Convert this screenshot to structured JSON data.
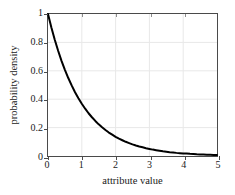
{
  "chart_data": {
    "type": "line",
    "title": "",
    "xlabel": "attribute value",
    "ylabel": "probability density",
    "xlim": [
      0,
      5
    ],
    "ylim": [
      0,
      1
    ],
    "xticks": [
      0,
      1,
      2,
      3,
      4,
      5
    ],
    "xtick_labels": [
      "0",
      "1",
      "2",
      "3",
      "4",
      "5"
    ],
    "yticks": [
      0,
      0.2,
      0.4,
      0.6,
      0.8,
      1
    ],
    "ytick_labels": [
      "0",
      "0.2",
      "0.4",
      "0.6",
      "0.8",
      "1"
    ],
    "grid": true,
    "legend": null,
    "series": [
      {
        "name": "exponential density",
        "function": "exp(-x)",
        "color": "#000000",
        "linewidth": 2,
        "x": [
          0,
          0.1,
          0.2,
          0.3,
          0.4,
          0.5,
          0.6,
          0.7,
          0.8,
          0.9,
          1,
          1.1,
          1.2,
          1.3,
          1.4,
          1.5,
          1.6,
          1.7,
          1.8,
          1.9,
          2,
          2.1,
          2.2,
          2.3,
          2.4,
          2.5,
          2.6,
          2.7,
          2.8,
          2.9,
          3,
          3.1,
          3.2,
          3.3,
          3.4,
          3.5,
          3.6,
          3.7,
          3.8,
          3.9,
          4,
          4.1,
          4.2,
          4.3,
          4.4,
          4.5,
          4.6,
          4.7,
          4.8,
          4.9,
          5
        ],
        "y": [
          1,
          0.905,
          0.819,
          0.741,
          0.67,
          0.607,
          0.549,
          0.497,
          0.449,
          0.407,
          0.368,
          0.333,
          0.301,
          0.273,
          0.247,
          0.223,
          0.202,
          0.183,
          0.165,
          0.15,
          0.135,
          0.122,
          0.111,
          0.1,
          0.091,
          0.082,
          0.074,
          0.067,
          0.061,
          0.055,
          0.05,
          0.045,
          0.041,
          0.037,
          0.033,
          0.03,
          0.027,
          0.025,
          0.022,
          0.02,
          0.018,
          0.017,
          0.015,
          0.014,
          0.012,
          0.011,
          0.01,
          0.009,
          0.008,
          0.007,
          0.007
        ]
      }
    ],
    "colors": {
      "curve": "#000000",
      "frame": "#4a4a4a",
      "grid": "#e8e8e8",
      "background": "#ffffff",
      "text": "#1a1a1a"
    }
  }
}
